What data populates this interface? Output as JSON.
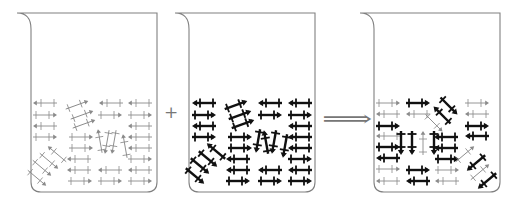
{
  "figure": {
    "operators": {
      "plus": "+",
      "yields": "⟹"
    },
    "colors": {
      "outline": "#808080",
      "thin": "#8a8a8a",
      "thick": "#111111",
      "background": "#ffffff"
    }
  },
  "beakers": [
    {
      "id": "beaker-1",
      "label": "thin-molecules",
      "x": 17,
      "style": "thin",
      "arrows": [
        {
          "x": 45,
          "y": 103,
          "a": 180,
          "s": "thin"
        },
        {
          "x": 45,
          "y": 115,
          "a": 0,
          "s": "thin"
        },
        {
          "x": 45,
          "y": 126,
          "a": 180,
          "s": "thin"
        },
        {
          "x": 45,
          "y": 137,
          "a": 0,
          "s": "thin"
        },
        {
          "x": 77,
          "y": 105,
          "a": -20,
          "s": "thin"
        },
        {
          "x": 82,
          "y": 115,
          "a": -20,
          "s": "thin"
        },
        {
          "x": 84,
          "y": 124,
          "a": -20,
          "s": "thin"
        },
        {
          "x": 81,
          "y": 137,
          "a": 0,
          "s": "thin"
        },
        {
          "x": 81,
          "y": 148,
          "a": 0,
          "s": "thin"
        },
        {
          "x": 79,
          "y": 159,
          "a": 180,
          "s": "thin"
        },
        {
          "x": 79,
          "y": 170,
          "a": 180,
          "s": "thin"
        },
        {
          "x": 80,
          "y": 181,
          "a": 0,
          "s": "thin"
        },
        {
          "x": 111,
          "y": 103,
          "a": 180,
          "s": "thin"
        },
        {
          "x": 110,
          "y": 115,
          "a": 0,
          "s": "thin"
        },
        {
          "x": 110,
          "y": 170,
          "a": 180,
          "s": "thin"
        },
        {
          "x": 110,
          "y": 181,
          "a": 0,
          "s": "thin"
        },
        {
          "x": 140,
          "y": 103,
          "a": 180,
          "s": "thin"
        },
        {
          "x": 140,
          "y": 115,
          "a": 0,
          "s": "thin"
        },
        {
          "x": 140,
          "y": 126,
          "a": 180,
          "s": "thin"
        },
        {
          "x": 140,
          "y": 137,
          "a": 180,
          "s": "thin"
        },
        {
          "x": 140,
          "y": 148,
          "a": 180,
          "s": "thin"
        },
        {
          "x": 140,
          "y": 159,
          "a": 0,
          "s": "thin"
        },
        {
          "x": 140,
          "y": 170,
          "a": 180,
          "s": "thin"
        },
        {
          "x": 140,
          "y": 181,
          "a": 0,
          "s": "thin"
        },
        {
          "x": 100,
          "y": 141,
          "a": -100,
          "s": "thin"
        },
        {
          "x": 107,
          "y": 142,
          "a": 100,
          "s": "thin"
        },
        {
          "x": 114,
          "y": 142,
          "a": 100,
          "s": "thin"
        },
        {
          "x": 125,
          "y": 146,
          "a": -100,
          "s": "thin"
        },
        {
          "x": 57,
          "y": 154,
          "a": -140,
          "s": "thin"
        },
        {
          "x": 49,
          "y": 161,
          "a": 40,
          "s": "thin"
        },
        {
          "x": 42,
          "y": 168,
          "a": 40,
          "s": "thin"
        },
        {
          "x": 37,
          "y": 178,
          "a": 40,
          "s": "thin"
        }
      ]
    },
    {
      "id": "beaker-2",
      "label": "thick-molecules",
      "x": 175,
      "style": "thick",
      "arrows": [
        {
          "x": 204,
          "y": 103,
          "a": 180,
          "s": "thick"
        },
        {
          "x": 204,
          "y": 115,
          "a": 0,
          "s": "thick"
        },
        {
          "x": 204,
          "y": 126,
          "a": 180,
          "s": "thick"
        },
        {
          "x": 204,
          "y": 137,
          "a": 0,
          "s": "thick"
        },
        {
          "x": 236,
          "y": 105,
          "a": -20,
          "s": "thick"
        },
        {
          "x": 240,
          "y": 115,
          "a": -20,
          "s": "thick"
        },
        {
          "x": 243,
          "y": 124,
          "a": -20,
          "s": "thick"
        },
        {
          "x": 240,
          "y": 137,
          "a": 0,
          "s": "thick"
        },
        {
          "x": 240,
          "y": 148,
          "a": 0,
          "s": "thick"
        },
        {
          "x": 238,
          "y": 159,
          "a": 180,
          "s": "thick"
        },
        {
          "x": 238,
          "y": 170,
          "a": 180,
          "s": "thick"
        },
        {
          "x": 238,
          "y": 181,
          "a": 0,
          "s": "thick"
        },
        {
          "x": 270,
          "y": 103,
          "a": 180,
          "s": "thick"
        },
        {
          "x": 270,
          "y": 115,
          "a": 0,
          "s": "thick"
        },
        {
          "x": 270,
          "y": 170,
          "a": 180,
          "s": "thick"
        },
        {
          "x": 270,
          "y": 181,
          "a": 0,
          "s": "thick"
        },
        {
          "x": 300,
          "y": 103,
          "a": 180,
          "s": "thick"
        },
        {
          "x": 300,
          "y": 115,
          "a": 0,
          "s": "thick"
        },
        {
          "x": 300,
          "y": 126,
          "a": 180,
          "s": "thick"
        },
        {
          "x": 300,
          "y": 137,
          "a": 180,
          "s": "thick"
        },
        {
          "x": 300,
          "y": 148,
          "a": 180,
          "s": "thick"
        },
        {
          "x": 300,
          "y": 159,
          "a": 0,
          "s": "thick"
        },
        {
          "x": 300,
          "y": 170,
          "a": 180,
          "s": "thick"
        },
        {
          "x": 300,
          "y": 181,
          "a": 0,
          "s": "thick"
        },
        {
          "x": 258,
          "y": 141,
          "a": 100,
          "s": "thick"
        },
        {
          "x": 266,
          "y": 142,
          "a": -100,
          "s": "thick"
        },
        {
          "x": 274,
          "y": 142,
          "a": 100,
          "s": "thick"
        },
        {
          "x": 285,
          "y": 146,
          "a": 100,
          "s": "thick"
        },
        {
          "x": 216,
          "y": 151,
          "a": -140,
          "s": "thick"
        },
        {
          "x": 208,
          "y": 159,
          "a": 40,
          "s": "thick"
        },
        {
          "x": 200,
          "y": 166,
          "a": 40,
          "s": "thick"
        },
        {
          "x": 195,
          "y": 176,
          "a": 40,
          "s": "thick"
        }
      ]
    },
    {
      "id": "beaker-3",
      "label": "mixed-molecules",
      "x": 360,
      "style": "mixed",
      "arrows": [
        {
          "x": 388,
          "y": 103,
          "a": 0,
          "s": "thin"
        },
        {
          "x": 388,
          "y": 114,
          "a": 180,
          "s": "thin"
        },
        {
          "x": 388,
          "y": 126,
          "a": 0,
          "s": "thick"
        },
        {
          "x": 388,
          "y": 136,
          "a": 180,
          "s": "thin"
        },
        {
          "x": 388,
          "y": 147,
          "a": 0,
          "s": "thick"
        },
        {
          "x": 388,
          "y": 158,
          "a": 180,
          "s": "thick"
        },
        {
          "x": 388,
          "y": 169,
          "a": 0,
          "s": "thin"
        },
        {
          "x": 388,
          "y": 181,
          "a": 180,
          "s": "thin"
        },
        {
          "x": 418,
          "y": 103,
          "a": 0,
          "s": "thick"
        },
        {
          "x": 418,
          "y": 114,
          "a": 180,
          "s": "thin"
        },
        {
          "x": 418,
          "y": 170,
          "a": 0,
          "s": "thick"
        },
        {
          "x": 418,
          "y": 181,
          "a": 180,
          "s": "thick"
        },
        {
          "x": 401,
          "y": 143,
          "a": 90,
          "s": "thick"
        },
        {
          "x": 412,
          "y": 143,
          "a": 90,
          "s": "thick"
        },
        {
          "x": 423,
          "y": 143,
          "a": -90,
          "s": "thin"
        },
        {
          "x": 434,
          "y": 143,
          "a": 90,
          "s": "thick"
        },
        {
          "x": 446,
          "y": 137,
          "a": 180,
          "s": "thick"
        },
        {
          "x": 446,
          "y": 148,
          "a": 180,
          "s": "thick"
        },
        {
          "x": 447,
          "y": 159,
          "a": 0,
          "s": "thick"
        },
        {
          "x": 447,
          "y": 170,
          "a": 0,
          "s": "thin"
        },
        {
          "x": 447,
          "y": 181,
          "a": 180,
          "s": "thin"
        },
        {
          "x": 449,
          "y": 106,
          "a": 45,
          "s": "thick"
        },
        {
          "x": 442,
          "y": 115,
          "a": -135,
          "s": "thick"
        },
        {
          "x": 434,
          "y": 123,
          "a": 45,
          "s": "thin"
        },
        {
          "x": 477,
          "y": 103,
          "a": 0,
          "s": "thin"
        },
        {
          "x": 477,
          "y": 114,
          "a": 180,
          "s": "thin"
        },
        {
          "x": 477,
          "y": 126,
          "a": 0,
          "s": "thick"
        },
        {
          "x": 477,
          "y": 136,
          "a": 180,
          "s": "thick"
        },
        {
          "x": 465,
          "y": 154,
          "a": -40,
          "s": "thin"
        },
        {
          "x": 476,
          "y": 163,
          "a": 140,
          "s": "thick"
        },
        {
          "x": 480,
          "y": 172,
          "a": -40,
          "s": "thin"
        },
        {
          "x": 487,
          "y": 181,
          "a": 140,
          "s": "thick"
        }
      ]
    }
  ]
}
